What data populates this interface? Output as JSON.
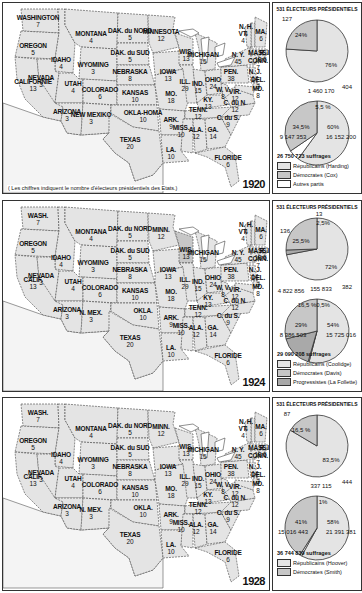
{
  "colors": {
    "republican": "#e4e4e4",
    "democrat": "#c7c7c7",
    "progressive": "#a9a9a9",
    "other": "#ffffff",
    "border": "#333333"
  },
  "side_title": "531 ÉLECTEURS PRÉSIDENTIELS",
  "map_note": "( Les chiffres indiquent le nombre d'électeurs présidentiels des Etats.)",
  "states": [
    {
      "id": "wash",
      "name": "WASHINGTON",
      "alt": "WASH.",
      "votes": "7"
    },
    {
      "id": "oregon",
      "name": "OREGON",
      "votes": "5"
    },
    {
      "id": "calif",
      "name": "CALIFORNIE",
      "alt": "CALIF.",
      "votes": "13"
    },
    {
      "id": "idaho",
      "name": "IDAHO",
      "votes": "4"
    },
    {
      "id": "nevada",
      "name": "NEVADA",
      "votes": "3"
    },
    {
      "id": "montana",
      "name": "MONTANA",
      "votes": "4"
    },
    {
      "id": "wyoming",
      "name": "WYOMING",
      "votes": "3"
    },
    {
      "id": "utah",
      "name": "UTAH",
      "votes": "4"
    },
    {
      "id": "arizona",
      "name": "ARIZONA",
      "votes": "3"
    },
    {
      "id": "colorado",
      "name": "COLORADO",
      "votes": "6"
    },
    {
      "id": "newmexico",
      "name": "NEW MEXIKO",
      "alt": "N. MEX.",
      "votes": "3"
    },
    {
      "id": "ndak",
      "name": "DAK. du NORD",
      "votes": "5"
    },
    {
      "id": "sdak",
      "name": "DAK. du SUD",
      "votes": "5"
    },
    {
      "id": "nebraska",
      "name": "NEBRASKA",
      "votes": "8"
    },
    {
      "id": "kansas",
      "name": "KANSAS",
      "votes": "10"
    },
    {
      "id": "okla",
      "name": "OKLA-HOMA",
      "alt": "OKLA.",
      "votes": "10"
    },
    {
      "id": "texas",
      "name": "TEXAS",
      "votes": "20"
    },
    {
      "id": "minn",
      "name": "MINNESOTA",
      "alt": "MINN.",
      "votes": "12"
    },
    {
      "id": "iowa",
      "name": "IOWA",
      "votes": "13"
    },
    {
      "id": "mo",
      "name": "MO.",
      "votes": "18"
    },
    {
      "id": "ark",
      "name": "ARK.",
      "votes": "9"
    },
    {
      "id": "la",
      "name": "LA.",
      "votes": "10"
    },
    {
      "id": "wis",
      "name": "WIS.",
      "votes": "13"
    },
    {
      "id": "ill",
      "name": "ILL.",
      "votes": "29"
    },
    {
      "id": "mich",
      "name": "MICHIGAN",
      "votes": "15"
    },
    {
      "id": "ind",
      "name": "IND.",
      "votes": "15"
    },
    {
      "id": "ohio",
      "name": "OHIO",
      "votes": "24"
    },
    {
      "id": "ky",
      "name": "KY.",
      "votes": "13"
    },
    {
      "id": "tenn",
      "name": "TENN.",
      "votes": "12"
    },
    {
      "id": "miss",
      "name": "MISS.",
      "votes": "10"
    },
    {
      "id": "ala",
      "name": "ALA.",
      "votes": "12"
    },
    {
      "id": "ga",
      "name": "GA.",
      "votes": "14"
    },
    {
      "id": "florida",
      "name": "FLORIDE",
      "votes": "6"
    },
    {
      "id": "sc",
      "name": "C. du S.",
      "votes": "9"
    },
    {
      "id": "nc",
      "name": "C. du N.",
      "votes": "12"
    },
    {
      "id": "vir",
      "name": "VIR.",
      "votes": "12"
    },
    {
      "id": "wv",
      "name": "W. V.",
      "votes": "8"
    },
    {
      "id": "pen",
      "name": "PEN.",
      "votes": "38"
    },
    {
      "id": "ny",
      "name": "N. Y.",
      "votes": "45"
    },
    {
      "id": "nj",
      "name": "N. J.",
      "votes": "14"
    },
    {
      "id": "del",
      "name": "DEL.",
      "votes": "3"
    },
    {
      "id": "md",
      "name": "MD.",
      "votes": "8"
    },
    {
      "id": "nh",
      "name": "N. H.",
      "votes": "4"
    },
    {
      "id": "vt",
      "name": "VT.",
      "votes": "4"
    },
    {
      "id": "ma",
      "name": "MA.",
      "votes": "6"
    },
    {
      "id": "mass",
      "name": "MASS.",
      "votes": "18"
    },
    {
      "id": "conn",
      "name": "CONN.",
      "votes": "7"
    },
    {
      "id": "ri",
      "name": "R. I.",
      "votes": "5"
    }
  ],
  "panels": [
    {
      "year": "1920",
      "show_note": true,
      "total": "26 750 723 suffrages",
      "legend": [
        {
          "key": "republican",
          "label": "Républicains  (Harding)"
        },
        {
          "key": "democrat",
          "label": "Démocrates  (Cox)"
        },
        {
          "key": "other",
          "label": "Autres partis"
        }
      ],
      "electoral": [
        {
          "party": "republican",
          "electors": 404,
          "percent": "76%"
        },
        {
          "party": "democrat",
          "electors": 127,
          "percent": "24%"
        }
      ],
      "popular": [
        {
          "party": "republican",
          "votes": "16 152 200",
          "percent": "60%"
        },
        {
          "party": "other",
          "votes": "1 460 170",
          "percent": "5,5 %"
        },
        {
          "party": "democrat",
          "votes": "9 147 353",
          "percent": "34,5%"
        }
      ],
      "popular_shares": [
        60,
        5.5,
        34.5
      ],
      "electoral_shares": [
        76,
        24
      ],
      "highlight": []
    },
    {
      "year": "1924",
      "show_note": false,
      "total": "29 090 208 suffrages",
      "legend": [
        {
          "key": "republican",
          "label": "Républicains  (Coolidge)"
        },
        {
          "key": "democrat",
          "label": "Démocrates  (Davis)"
        },
        {
          "key": "progressive",
          "label": "Progressistes (La Follette)"
        }
      ],
      "electoral": [
        {
          "party": "republican",
          "electors": 382,
          "percent": "72%"
        },
        {
          "party": "progressive",
          "electors": 13,
          "percent": "2,5%"
        },
        {
          "party": "democrat",
          "electors": 136,
          "percent": "25,5%"
        }
      ],
      "popular": [
        {
          "party": "republican",
          "votes": "15 725 016",
          "percent": "54%"
        },
        {
          "party": "other",
          "votes": "155 833",
          "percent": "0,5%"
        },
        {
          "party": "progressive",
          "votes": "4 822 856",
          "percent": "16,5 %"
        },
        {
          "party": "democrat",
          "votes": "8 386 503",
          "percent": "29%"
        }
      ],
      "popular_shares": [
        54,
        0.5,
        16.5,
        29
      ],
      "electoral_shares": [
        72,
        2.5,
        25.5
      ],
      "highlight": [
        "wis"
      ]
    },
    {
      "year": "1928",
      "show_note": false,
      "total": "36 744 839 suffrages",
      "legend": [
        {
          "key": "republican",
          "label": "Républicains  (Hoover)"
        },
        {
          "key": "democrat",
          "label": "Démocrates  (Smith)"
        }
      ],
      "electoral": [
        {
          "party": "republican",
          "electors": 444,
          "percent": "83,5%"
        },
        {
          "party": "democrat",
          "electors": 87,
          "percent": "16,5 %"
        }
      ],
      "popular": [
        {
          "party": "republican",
          "votes": "21 391 381",
          "percent": "58%"
        },
        {
          "party": "other",
          "votes": "337 115",
          "percent": "1%"
        },
        {
          "party": "democrat",
          "votes": "15 016 443",
          "percent": "41%"
        }
      ],
      "popular_shares": [
        58,
        1,
        41
      ],
      "electoral_shares": [
        83.5,
        16.5
      ],
      "highlight": []
    }
  ]
}
